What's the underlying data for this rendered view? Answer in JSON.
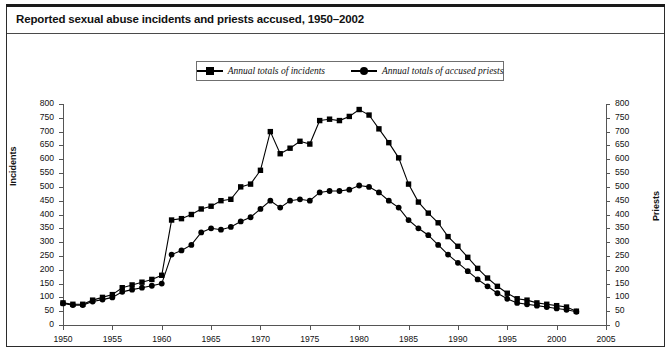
{
  "figure": {
    "title": "Reported sexual abuse incidents and priests accused, 1950–2002",
    "border_color": "#2b2b2b",
    "background": "#ffffff"
  },
  "legend": {
    "position": "top-center",
    "entries": [
      {
        "label": "Annual totals of incidents",
        "marker": "square",
        "color": "#000000"
      },
      {
        "label": "Annual totals of accused priests",
        "marker": "circle",
        "color": "#000000"
      }
    ]
  },
  "axes": {
    "x": {
      "label": "",
      "ticks": [
        "1950",
        "1955",
        "1960",
        "1965",
        "1970",
        "1975",
        "1980",
        "1985",
        "1990",
        "1995",
        "2000",
        "2005"
      ],
      "min": 1950,
      "max": 2005
    },
    "y_left": {
      "label": "Incidents",
      "ticks": [
        "0",
        "50",
        "100",
        "150",
        "200",
        "250",
        "300",
        "350",
        "400",
        "450",
        "500",
        "550",
        "600",
        "650",
        "700",
        "750",
        "800"
      ],
      "min": 0,
      "max": 800
    },
    "y_right": {
      "label": "Priests",
      "ticks": [
        "0",
        "50",
        "100",
        "150",
        "200",
        "250",
        "300",
        "350",
        "400",
        "450",
        "500",
        "550",
        "600",
        "650",
        "700",
        "750",
        "800"
      ],
      "min": 0,
      "max": 800
    }
  },
  "chart_data": {
    "type": "line",
    "title": "Reported sexual abuse incidents and priests accused, 1950–2002",
    "xlabel": "",
    "ylabel": "Incidents",
    "ylabel_right": "Priests",
    "xlim": [
      1950,
      2005
    ],
    "ylim": [
      0,
      800
    ],
    "grid": false,
    "legend_position": "top-center",
    "x": [
      1950,
      1951,
      1952,
      1953,
      1954,
      1955,
      1956,
      1957,
      1958,
      1959,
      1960,
      1961,
      1962,
      1963,
      1964,
      1965,
      1966,
      1967,
      1968,
      1969,
      1970,
      1971,
      1972,
      1973,
      1974,
      1975,
      1976,
      1977,
      1978,
      1979,
      1980,
      1981,
      1982,
      1983,
      1984,
      1985,
      1986,
      1987,
      1988,
      1989,
      1990,
      1991,
      1992,
      1993,
      1994,
      1995,
      1996,
      1997,
      1998,
      1999,
      2000,
      2001,
      2002
    ],
    "series": [
      {
        "name": "Annual totals of incidents",
        "marker": "square",
        "values": [
          80,
          75,
          75,
          90,
          100,
          110,
          135,
          145,
          155,
          165,
          180,
          380,
          385,
          400,
          420,
          430,
          450,
          455,
          500,
          510,
          560,
          700,
          620,
          640,
          665,
          655,
          740,
          745,
          740,
          755,
          780,
          760,
          710,
          660,
          605,
          510,
          445,
          405,
          370,
          320,
          285,
          245,
          205,
          170,
          140,
          115,
          95,
          90,
          80,
          75,
          70,
          65,
          50
        ]
      },
      {
        "name": "Annual totals of accused priests",
        "marker": "circle",
        "values": [
          78,
          72,
          72,
          85,
          92,
          100,
          120,
          128,
          135,
          142,
          150,
          255,
          270,
          290,
          335,
          350,
          345,
          355,
          375,
          390,
          420,
          450,
          425,
          450,
          455,
          450,
          480,
          485,
          485,
          490,
          505,
          500,
          480,
          450,
          425,
          380,
          350,
          325,
          290,
          255,
          225,
          195,
          165,
          140,
          115,
          95,
          80,
          75,
          70,
          65,
          60,
          55,
          48
        ]
      }
    ]
  }
}
